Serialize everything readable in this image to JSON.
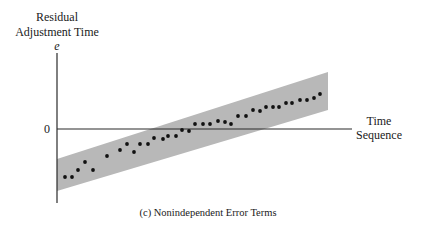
{
  "chart_data": {
    "type": "scatter",
    "title": "(c) Nonindependent Error Terms",
    "ylabel_lines": [
      "Residual",
      "Adjustment Time"
    ],
    "ylabel_symbol": "e",
    "xlabel_lines": [
      "Time",
      "Sequence"
    ],
    "y_ticks": [
      "0"
    ],
    "grid": false,
    "legend": null,
    "band": {
      "description": "shaded band showing upward trend of residuals over time",
      "color": "#b8b8b8",
      "lower_left": -1.77,
      "upper_left": -0.86,
      "lower_right": 0.54,
      "upper_right": 1.63
    },
    "x": [
      1,
      2,
      3,
      4,
      5,
      6,
      7,
      8,
      9,
      10,
      11,
      12,
      13,
      14,
      15,
      16,
      17,
      18,
      19,
      20,
      21,
      22,
      23,
      24,
      25,
      26,
      27,
      28,
      29,
      30,
      31,
      32,
      33,
      34,
      35,
      36
    ],
    "values": [
      -1.37,
      -1.37,
      -1.17,
      -0.94,
      -1.17,
      -0.77,
      -0.6,
      -0.43,
      -0.66,
      -0.43,
      -0.43,
      -0.26,
      -0.29,
      -0.2,
      -0.2,
      -0.03,
      -0.06,
      0.14,
      0.14,
      0.14,
      0.23,
      0.2,
      0.14,
      0.37,
      0.37,
      0.54,
      0.51,
      0.63,
      0.63,
      0.63,
      0.74,
      0.74,
      0.83,
      0.83,
      0.89,
      1.0
    ]
  },
  "render": {
    "axis_color": "#2a2a2a",
    "band_color": "#b8b8b8",
    "point_color": "#111111",
    "origin_x": 57,
    "zero_y": 129,
    "y_axis_top": 53,
    "y_axis_bottom": 203,
    "x_axis_end": 352,
    "px_per_unit": 35,
    "band_poly": [
      [
        57,
        159
      ],
      [
        328,
        72
      ],
      [
        328,
        110
      ],
      [
        57,
        191
      ]
    ],
    "points_px": [
      [
        65,
        177
      ],
      [
        72,
        177
      ],
      [
        78,
        170
      ],
      [
        85,
        162
      ],
      [
        93,
        170
      ],
      [
        107,
        156
      ],
      [
        120,
        150
      ],
      [
        127,
        144
      ],
      [
        134,
        152
      ],
      [
        140,
        144
      ],
      [
        148,
        144
      ],
      [
        154,
        138
      ],
      [
        163,
        139
      ],
      [
        168,
        136
      ],
      [
        176,
        136
      ],
      [
        182,
        130
      ],
      [
        189,
        131
      ],
      [
        195,
        124
      ],
      [
        203,
        124
      ],
      [
        210,
        124
      ],
      [
        218,
        121
      ],
      [
        225,
        122
      ],
      [
        231,
        124
      ],
      [
        238,
        116
      ],
      [
        246,
        116
      ],
      [
        253,
        110
      ],
      [
        260,
        111
      ],
      [
        266,
        107
      ],
      [
        273,
        107
      ],
      [
        279,
        107
      ],
      [
        286,
        103
      ],
      [
        292,
        103
      ],
      [
        300,
        100
      ],
      [
        307,
        100
      ],
      [
        314,
        98
      ],
      [
        320,
        94
      ]
    ]
  }
}
